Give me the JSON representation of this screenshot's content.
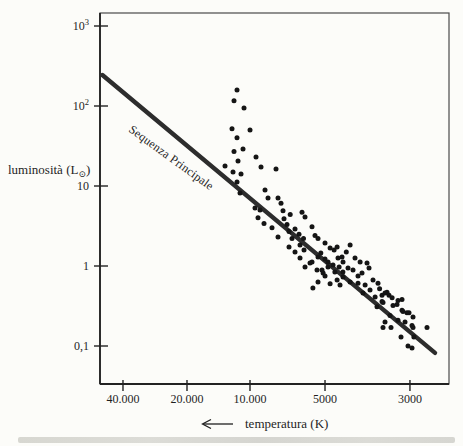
{
  "figure": {
    "y_axis_title_prefix": "luminosità (L",
    "y_axis_title_sub": "⊙",
    "y_axis_title_suffix": ")",
    "x_axis_title": "temperatura (K)",
    "line_label": "Sequenza Principale"
  },
  "colors": {
    "page_bg": "#fcfcf9",
    "ink": "#1f1f1f",
    "frame": "#4a4a4a",
    "axis": "#222222",
    "line": "#2d2d2d",
    "dot": "#151515",
    "bottom_bar": "#d8d8d3"
  },
  "chart_data": {
    "type": "scatter",
    "title": "",
    "xlabel": "temperatura (K)",
    "ylabel": "luminosità (L⊙)",
    "x_scale": "log-reversed",
    "y_scale": "log",
    "xlim": [
      55000,
      2450
    ],
    "ylim": [
      0.033,
      1450
    ],
    "grid": false,
    "legend": "none",
    "x_ticks": [
      {
        "value": 40000,
        "label": "40.000"
      },
      {
        "value": 20000,
        "label": "20.000"
      },
      {
        "value": 10000,
        "label": "10.000"
      },
      {
        "value": 5000,
        "label": "5000"
      },
      {
        "value": 3000,
        "label": "3000"
      }
    ],
    "y_ticks": [
      {
        "value": 1000,
        "label": "10³",
        "base": "10",
        "sup": "3"
      },
      {
        "value": 100,
        "label": "10²",
        "base": "10",
        "sup": "2"
      },
      {
        "value": 10,
        "label": "10",
        "base": "10",
        "sup": ""
      },
      {
        "value": 1,
        "label": "1",
        "base": "1",
        "sup": ""
      },
      {
        "value": 0.1,
        "label": "0,1",
        "base": "0,1",
        "sup": ""
      }
    ],
    "main_sequence_line": {
      "label": "Sequenza Principale",
      "from": {
        "t": 50000,
        "l": 244
      },
      "to": {
        "t": 2580,
        "l": 0.082
      }
    },
    "points_units": "[temperature_K, luminosity_Lsun]",
    "points": [
      [
        11540,
        158
      ],
      [
        11930,
        116
      ],
      [
        10680,
        94
      ],
      [
        12190,
        52
      ],
      [
        10000,
        50
      ],
      [
        11540,
        40
      ],
      [
        10800,
        29
      ],
      [
        11930,
        27
      ],
      [
        9460,
        23
      ],
      [
        11410,
        20.5
      ],
      [
        13170,
        17.8
      ],
      [
        9030,
        17.3
      ],
      [
        12060,
        15
      ],
      [
        7865,
        16.3
      ],
      [
        11040,
        14.1
      ],
      [
        11540,
        11.2
      ],
      [
        8705,
        8.9
      ],
      [
        11160,
        8.2
      ],
      [
        8470,
        7.1
      ],
      [
        7720,
        7.1
      ],
      [
        7510,
        6.1
      ],
      [
        9550,
        5.3
      ],
      [
        9120,
        5.0
      ],
      [
        7370,
        4.9
      ],
      [
        6185,
        4.7
      ],
      [
        6900,
        4.4
      ],
      [
        6015,
        4.1
      ],
      [
        9290,
        4.0
      ],
      [
        7305,
        3.9
      ],
      [
        8785,
        3.4
      ],
      [
        7105,
        3.3
      ],
      [
        5640,
        3.1
      ],
      [
        8160,
        3.0
      ],
      [
        6600,
        2.9
      ],
      [
        6975,
        2.7
      ],
      [
        6360,
        2.5
      ],
      [
        5485,
        2.4
      ],
      [
        7720,
        2.3
      ],
      [
        6785,
        2.2
      ],
      [
        6100,
        2.2
      ],
      [
        5335,
        2.2
      ],
      [
        5000,
        1.94
      ],
      [
        6300,
        1.83
      ],
      [
        6975,
        1.73
      ],
      [
        6070,
        1.58
      ],
      [
        6600,
        1.5
      ],
      [
        4850,
        1.68
      ],
      [
        4735,
        1.58
      ],
      [
        5200,
        1.45
      ],
      [
        5335,
        1.3
      ],
      [
        5000,
        1.22
      ],
      [
        5640,
        1.12
      ],
      [
        6300,
        1.26
      ],
      [
        4625,
        1.26
      ],
      [
        4487,
        1.12
      ],
      [
        4910,
        0.97
      ],
      [
        5140,
        0.89
      ],
      [
        4710,
        0.84
      ],
      [
        4490,
        0.84
      ],
      [
        5335,
        0.63
      ],
      [
        4850,
        0.6
      ],
      [
        4570,
        0.58
      ],
      [
        5745,
        1.09
      ],
      [
        6015,
        0.97
      ],
      [
        5385,
        0.89
      ],
      [
        5090,
        0.82
      ],
      [
        4910,
        1.12
      ],
      [
        5590,
        0.53
      ],
      [
        5000,
        0.75
      ],
      [
        4300,
        1.83
      ],
      [
        4650,
        1.73
      ],
      [
        4515,
        1.3
      ],
      [
        4400,
        1.5
      ],
      [
        4175,
        1.26
      ],
      [
        4050,
        1.12
      ],
      [
        4765,
        1.03
      ],
      [
        4595,
        0.97
      ],
      [
        4355,
        0.94
      ],
      [
        4225,
        0.89
      ],
      [
        3885,
        1.09
      ],
      [
        3838,
        0.94
      ],
      [
        4003,
        0.82
      ],
      [
        4487,
        0.73
      ],
      [
        4650,
        0.67
      ],
      [
        4300,
        0.63
      ],
      [
        4100,
        0.61
      ],
      [
        3930,
        0.58
      ],
      [
        3746,
        0.67
      ],
      [
        3636,
        0.61
      ],
      [
        3815,
        0.5
      ],
      [
        3980,
        0.46
      ],
      [
        3700,
        0.41
      ],
      [
        3549,
        0.43
      ],
      [
        3444,
        0.47
      ],
      [
        3341,
        0.4
      ],
      [
        3527,
        0.35
      ],
      [
        3658,
        0.31
      ],
      [
        3243,
        0.33
      ],
      [
        3147,
        0.28
      ],
      [
        3054,
        0.26
      ],
      [
        2946,
        0.23
      ],
      [
        3382,
        0.24
      ],
      [
        3224,
        0.21
      ],
      [
        3091,
        0.2
      ],
      [
        2964,
        0.18
      ],
      [
        4100,
        0.75
      ],
      [
        3600,
        0.52
      ],
      [
        3485,
        0.46
      ],
      [
        3403,
        0.43
      ],
      [
        3549,
        0.36
      ],
      [
        3224,
        0.37
      ],
      [
        3322,
        0.32
      ],
      [
        3128,
        0.27
      ],
      [
        3485,
        0.2
      ],
      [
        3527,
        0.17
      ],
      [
        3362,
        0.17
      ],
      [
        2946,
        0.17
      ],
      [
        3166,
        0.13
      ],
      [
        3036,
        0.1
      ],
      [
        3147,
        0.38
      ],
      [
        3018,
        0.26
      ],
      [
        2708,
        0.17
      ],
      [
        2929,
        0.13
      ],
      [
        2964,
        0.094
      ]
    ]
  }
}
